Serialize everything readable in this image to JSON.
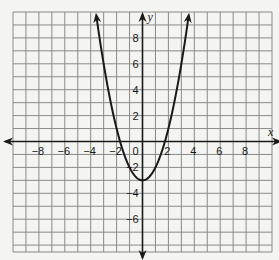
{
  "chart_data": {
    "type": "line",
    "title": "",
    "xlabel": "x",
    "ylabel": "y",
    "xlim": [
      -10,
      10
    ],
    "ylim": [
      -8.5,
      10
    ],
    "grid": true,
    "x_ticks": [
      -8,
      -6,
      -4,
      -2,
      2,
      4,
      6,
      8
    ],
    "y_ticks": [
      8,
      6,
      4,
      2,
      -2,
      -4,
      -6
    ],
    "origin_label": "0",
    "series": [
      {
        "name": "parabola",
        "equation": "y = x^2 - 3",
        "vertex": [
          0,
          -3
        ],
        "x_intercepts": [
          -1.73,
          1.73
        ],
        "x": [
          -3.6,
          -3,
          -2,
          -1,
          0,
          1,
          2,
          3,
          3.6
        ],
        "y": [
          9.96,
          6,
          1,
          -2,
          -3,
          -2,
          1,
          6,
          9.96
        ]
      }
    ]
  },
  "colors": {
    "background": "#f4f4f2",
    "grid": "#8a8a8a",
    "axis": "#1a1a1a",
    "curve": "#1a1a1a"
  }
}
